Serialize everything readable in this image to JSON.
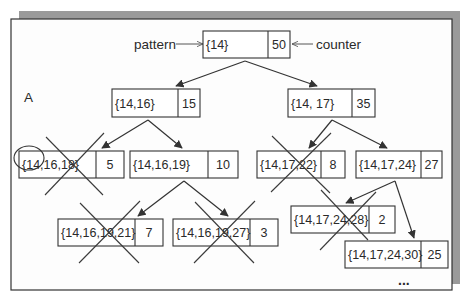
{
  "colors": {
    "background": "#ffffff",
    "shadow": "#9a9a9a",
    "panel": "#fdfdfd",
    "stroke": "#333333",
    "text": "#2a2a2a"
  },
  "frame": {
    "x": 11,
    "y": 19,
    "w": 441,
    "h": 271,
    "shadow_offset": 8
  },
  "labels": [
    {
      "id": "pattern",
      "text": "pattern",
      "x": 134,
      "y": 49
    },
    {
      "id": "counter",
      "text": "counter",
      "x": 316,
      "y": 49
    },
    {
      "id": "A",
      "text": "A",
      "x": 24,
      "y": 102
    }
  ],
  "ellipsis": {
    "text": "...",
    "x": 398,
    "y": 285
  },
  "nodes": [
    {
      "id": "root",
      "pattern": "{14}",
      "count": "50",
      "x": 203,
      "y": 31,
      "w": 87,
      "h": 27,
      "div": 65,
      "pruned": false
    },
    {
      "id": "n14_16",
      "pattern": "{14,16}",
      "count": "15",
      "x": 112,
      "y": 89,
      "w": 88,
      "h": 28,
      "div": 66,
      "pruned": false
    },
    {
      "id": "n14_17",
      "pattern": "{14, 17}",
      "count": "35",
      "x": 288,
      "y": 89,
      "w": 87,
      "h": 28,
      "div": 64,
      "pruned": false
    },
    {
      "id": "n14_16_18",
      "pattern": "{14,16,18}",
      "count": "5",
      "x": 19,
      "y": 151,
      "w": 105,
      "h": 27,
      "div": 77,
      "pruned": true
    },
    {
      "id": "n14_16_19",
      "pattern": "{14,16,19}",
      "count": "10",
      "x": 130,
      "y": 151,
      "w": 108,
      "h": 27,
      "div": 78,
      "pruned": false
    },
    {
      "id": "n14_17_22",
      "pattern": "{14,17,22}",
      "count": "8",
      "x": 257,
      "y": 151,
      "w": 88,
      "h": 27,
      "div": 64,
      "pruned": true
    },
    {
      "id": "n14_17_24",
      "pattern": "{14,17,24}",
      "count": "27",
      "x": 356,
      "y": 151,
      "w": 86,
      "h": 27,
      "div": 65,
      "pruned": false
    },
    {
      "id": "n14_16_19_21",
      "pattern": "{14,16,19,21}",
      "count": "7",
      "x": 58,
      "y": 219,
      "w": 105,
      "h": 27,
      "div": 77,
      "pruned": true
    },
    {
      "id": "n14_16_19_27",
      "pattern": "{14,16,19,27}",
      "count": "3",
      "x": 173,
      "y": 219,
      "w": 105,
      "h": 27,
      "div": 77,
      "pruned": true
    },
    {
      "id": "n14_17_24_28",
      "pattern": "{14,17,24,28}",
      "count": "2",
      "x": 291,
      "y": 206,
      "w": 104,
      "h": 27,
      "div": 78,
      "pruned": true
    },
    {
      "id": "n14_17_24_30",
      "pattern": "{14,17,24,30}",
      "count": "25",
      "x": 345,
      "y": 241,
      "w": 103,
      "h": 27,
      "div": 76,
      "pruned": false
    }
  ],
  "edges": [
    {
      "from": [
        245,
        61
      ],
      "to": [
        176,
        86
      ]
    },
    {
      "from": [
        245,
        61
      ],
      "to": [
        317,
        86
      ]
    },
    {
      "from": [
        148,
        120
      ],
      "to": [
        102,
        148
      ]
    },
    {
      "from": [
        148,
        120
      ],
      "to": [
        182,
        148
      ]
    },
    {
      "from": [
        332,
        120
      ],
      "to": [
        309,
        148
      ]
    },
    {
      "from": [
        332,
        120
      ],
      "to": [
        387,
        148
      ]
    },
    {
      "from": [
        184,
        181
      ],
      "to": [
        138,
        216
      ]
    },
    {
      "from": [
        184,
        181
      ],
      "to": [
        228,
        216
      ]
    },
    {
      "from": [
        395,
        181
      ],
      "to": [
        346,
        203
      ]
    },
    {
      "from": [
        395,
        181
      ],
      "to": [
        414,
        238
      ]
    }
  ],
  "pointer_arrows": [
    {
      "id": "pattern-arrow",
      "from": [
        176,
        44
      ],
      "to": [
        203,
        44
      ]
    },
    {
      "id": "counter-arrow",
      "from": [
        313,
        44
      ],
      "to": [
        292,
        44
      ]
    }
  ],
  "crosses": [
    {
      "node": "n14_16_18",
      "a": [
        [
          45,
          195
        ],
        [
          104,
          133
        ]
      ],
      "b": [
        [
          46,
          137
        ],
        [
          103,
          195
        ]
      ]
    },
    {
      "node": "n14_17_22",
      "a": [
        [
          271,
          192
        ],
        [
          331,
          133
        ]
      ],
      "b": [
        [
          272,
          136
        ],
        [
          330,
          193
        ]
      ]
    },
    {
      "node": "n14_16_19_21",
      "a": [
        [
          79,
          263
        ],
        [
          140,
          201
        ]
      ],
      "b": [
        [
          80,
          203
        ],
        [
          139,
          263
        ]
      ]
    },
    {
      "node": "n14_16_19_27",
      "a": [
        [
          194,
          263
        ],
        [
          255,
          201
        ]
      ],
      "b": [
        [
          195,
          202
        ],
        [
          254,
          263
        ]
      ]
    },
    {
      "node": "n14_17_24_28",
      "a": [
        [
          320,
          250
        ],
        [
          376,
          192
        ]
      ],
      "b": [
        [
          321,
          190
        ],
        [
          368,
          240
        ]
      ]
    }
  ],
  "circle": {
    "cx": 29,
    "cy": 158,
    "rx": 15,
    "ry": 12
  }
}
